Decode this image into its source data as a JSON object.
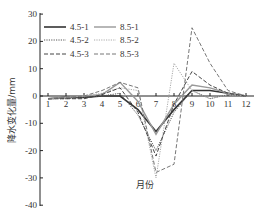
{
  "chart_data": {
    "type": "line",
    "title": "",
    "xlabel": "月份",
    "ylabel": "降水变化量/mm",
    "ylim": [
      -40,
      30
    ],
    "yticks": [
      30,
      20,
      10,
      0,
      -10,
      -20,
      -30,
      -40
    ],
    "categories": [
      "1",
      "2",
      "3",
      "4",
      "5",
      "6",
      "7",
      "8",
      "9",
      "10",
      "11",
      "12"
    ],
    "grid": false,
    "legend_position": "upper-left",
    "series": [
      {
        "name": "4.5-1",
        "color": "#333333",
        "dash": "",
        "width": 1.6,
        "values": [
          -1,
          -0.5,
          -0.5,
          0,
          0,
          -5,
          -13,
          -5,
          2,
          2,
          1,
          0
        ]
      },
      {
        "name": "8.5-1",
        "color": "#999999",
        "dash": "",
        "width": 1.4,
        "values": [
          -1,
          -0.5,
          0,
          0.5,
          5,
          -2,
          -14,
          -3,
          4,
          3,
          1,
          0
        ]
      },
      {
        "name": "4.5-2",
        "color": "#555555",
        "dash": "1.2,1.2",
        "width": 1.0,
        "values": [
          -1,
          -1,
          -0.5,
          0,
          1,
          -7,
          -20,
          -6,
          2,
          -1,
          0.5,
          0
        ]
      },
      {
        "name": "8.5-2",
        "color": "#aaaaaa",
        "dash": "1.2,1.2",
        "width": 1.0,
        "values": [
          -1,
          -0.5,
          0,
          1,
          3,
          2,
          -30,
          12,
          2,
          -1,
          0.5,
          0
        ]
      },
      {
        "name": "4.5-3",
        "color": "#444444",
        "dash": "4,2",
        "width": 1.0,
        "values": [
          -1,
          -1,
          -1,
          0.5,
          3,
          -6,
          -22,
          -3,
          9,
          4,
          1,
          0
        ]
      },
      {
        "name": "8.5-3",
        "color": "#777777",
        "dash": "4,2",
        "width": 1.0,
        "values": [
          -1,
          -0.5,
          0,
          2,
          5,
          3,
          -28,
          -25,
          25,
          12,
          2,
          0
        ]
      }
    ]
  },
  "legend": {
    "items": [
      {
        "label": "4.5-1"
      },
      {
        "label": "8.5-1"
      },
      {
        "label": "4.5-2"
      },
      {
        "label": "8.5-2"
      },
      {
        "label": "4.5-3"
      },
      {
        "label": "8.5-3"
      }
    ]
  }
}
